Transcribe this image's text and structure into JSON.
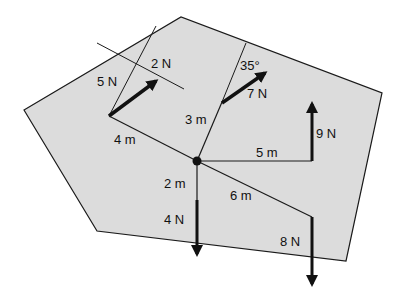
{
  "diagram": {
    "plate_color": "#dcdcdc",
    "line_color": "#1a1a1a",
    "forces": [
      {
        "id": "f2",
        "label": "2 N"
      },
      {
        "id": "f5",
        "label": "5 N"
      },
      {
        "id": "f7",
        "label": "7 N"
      },
      {
        "id": "f9",
        "label": "9 N"
      },
      {
        "id": "f4",
        "label": "4 N"
      },
      {
        "id": "f8",
        "label": "8 N"
      }
    ],
    "distances": [
      {
        "id": "d4",
        "label": "4 m"
      },
      {
        "id": "d3",
        "label": "3 m"
      },
      {
        "id": "d5",
        "label": "5 m"
      },
      {
        "id": "d2",
        "label": "2 m"
      },
      {
        "id": "d6",
        "label": "6 m"
      }
    ],
    "angle": {
      "label": "35°"
    }
  }
}
